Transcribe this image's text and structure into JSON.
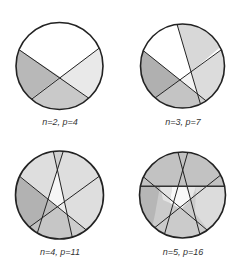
{
  "figure": {
    "panels": [
      {
        "label": "n=2, p=4",
        "n": 2,
        "p": 4
      },
      {
        "label": "n=3, p=7",
        "n": 3,
        "p": 7
      },
      {
        "label": "n=4, p=11",
        "n": 4,
        "p": 11
      },
      {
        "label": "n=5, p=16",
        "n": 5,
        "p": 16
      }
    ],
    "colors": {
      "outline": "#222222",
      "white": "#ffffff",
      "light": "#e6e6e6",
      "mid_light": "#d6d6d6",
      "mid": "#c6c6c6",
      "dark": "#b0b0b0"
    }
  }
}
